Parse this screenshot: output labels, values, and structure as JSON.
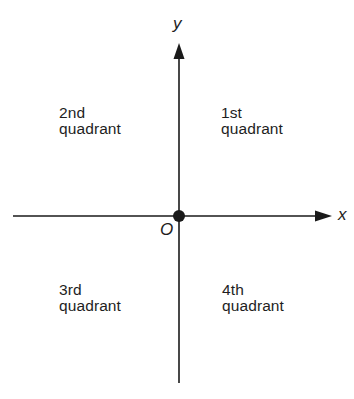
{
  "diagram": {
    "axes": {
      "x_label": "x",
      "y_label": "y",
      "origin_label": "O"
    },
    "quadrants": [
      {
        "id": "q1",
        "ordinal": "1st",
        "word": "quadrant"
      },
      {
        "id": "q2",
        "ordinal": "2nd",
        "word": "quadrant"
      },
      {
        "id": "q3",
        "ordinal": "3rd",
        "word": "quadrant"
      },
      {
        "id": "q4",
        "ordinal": "4th",
        "word": "quadrant"
      }
    ],
    "colors": {
      "axis": "#1a1a1a",
      "text": "#1e1e1e",
      "background": "#ffffff"
    }
  }
}
